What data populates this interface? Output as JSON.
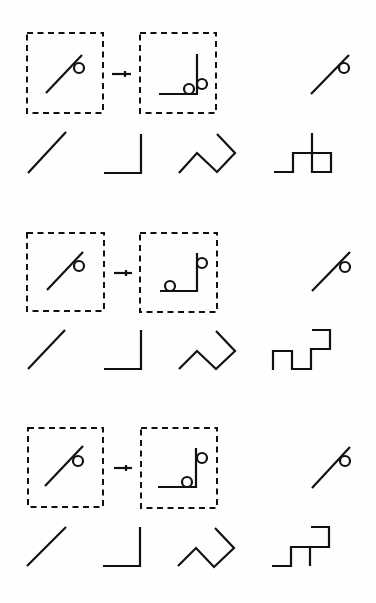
{
  "figure": {
    "description": "Three rows of symbol-grouping examples: a dashed box with a diagonal stroke-plus-loop symbol maps (arrow) to a dashed box with an L-shaped stroke with loops; right column shows the target symbol; bottom line of each row shows four stroke shapes: diagonal, L-corner, zigzag, step pattern.",
    "ink_color": "#111111",
    "background": "#fefefe",
    "rows": [
      {
        "index": 1,
        "source_box": {
          "x": 27,
          "y": 33,
          "w": 76,
          "h": 80
        },
        "source_stroke": {
          "x1": 46,
          "y1": 93,
          "x2": 82,
          "y2": 55
        },
        "source_loop": {
          "cx": 79,
          "cy": 68,
          "r": 5
        },
        "arrow": {
          "x1": 112,
          "x2": 131,
          "y": 74,
          "tick_x": 125
        },
        "target_box": {
          "x": 140,
          "y": 33,
          "w": 76,
          "h": 80
        },
        "target_path": "M159,94 L197,94 L197,54",
        "target_loops": [
          {
            "cx": 189,
            "cy": 89,
            "r": 5
          },
          {
            "cx": 202,
            "cy": 84,
            "r": 5
          }
        ],
        "result_stroke": {
          "x1": 311,
          "y1": 94,
          "x2": 349,
          "y2": 55
        },
        "result_loop": {
          "cx": 344,
          "cy": 68,
          "r": 5
        },
        "shapes": {
          "diagonal": "M28,173 L66,132",
          "corner": "M104,173 L141,173 L141,134",
          "zigzag": "M179,173 L197,153 L217,172 L235,153 L217,134",
          "steps": "M274,172 L293,172 L293,153 L331,153 L331,172 L312,172 L312,133"
        }
      },
      {
        "index": 2,
        "source_box": {
          "x": 27,
          "y": 233,
          "w": 77,
          "h": 78
        },
        "source_stroke": {
          "x1": 47,
          "y1": 290,
          "x2": 83,
          "y2": 252
        },
        "source_loop": {
          "cx": 79,
          "cy": 266,
          "r": 5
        },
        "arrow": {
          "x1": 114,
          "x2": 132,
          "y": 273,
          "tick_x": 126
        },
        "target_box": {
          "x": 140,
          "y": 233,
          "w": 77,
          "h": 79
        },
        "target_path": "M160,291 L197,291 L197,253",
        "target_loops": [
          {
            "cx": 170,
            "cy": 286,
            "r": 5
          },
          {
            "cx": 202,
            "cy": 263,
            "r": 5
          }
        ],
        "result_stroke": {
          "x1": 312,
          "y1": 291,
          "x2": 350,
          "y2": 252
        },
        "result_loop": {
          "cx": 345,
          "cy": 267,
          "r": 5
        },
        "shapes": {
          "diagonal": "M28,369 L65,330",
          "corner": "M104,369 L141,369 L141,330",
          "zigzag": "M179,369 L197,351 L216,369 L235,351 L216,331",
          "steps": "M273,370 L273,351 L292,351 L292,369 L311,369 L311,349 L330,349 L330,330 L312,330"
        }
      },
      {
        "index": 3,
        "source_box": {
          "x": 28,
          "y": 428,
          "w": 75,
          "h": 79
        },
        "source_stroke": {
          "x1": 45,
          "y1": 486,
          "x2": 83,
          "y2": 446
        },
        "source_loop": {
          "cx": 78,
          "cy": 461,
          "r": 5
        },
        "arrow": {
          "x1": 114,
          "x2": 132,
          "y": 468,
          "tick_x": 126
        },
        "target_box": {
          "x": 141,
          "y": 428,
          "w": 76,
          "h": 80
        },
        "target_path": "M158,487 L196,487 L196,448",
        "target_loops": [
          {
            "cx": 187,
            "cy": 482,
            "r": 5
          },
          {
            "cx": 202,
            "cy": 458,
            "r": 5
          }
        ],
        "result_stroke": {
          "x1": 312,
          "y1": 488,
          "x2": 350,
          "y2": 447
        },
        "result_loop": {
          "cx": 345,
          "cy": 461,
          "r": 5
        },
        "shapes": {
          "diagonal": "M27,566 L66,527",
          "corner": "M103,566 L140,566 L140,527",
          "zigzag": "M178,566 L196,548 L214,567 L234,548 L215,528",
          "steps": "M272,566 L291,566 L291,547 L329,547 L329,527 L311,527 M310,547 L310,566"
        }
      }
    ]
  }
}
